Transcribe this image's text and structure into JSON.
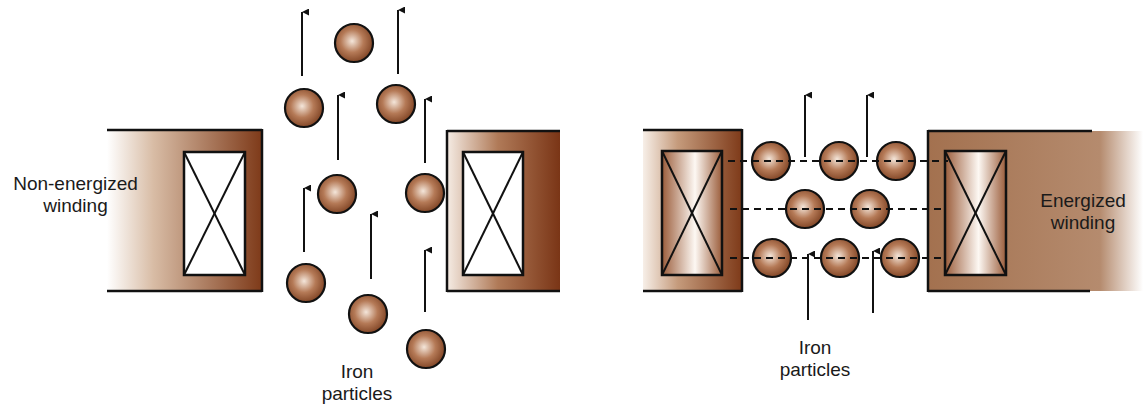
{
  "panels": [
    {
      "id": "non-energized",
      "winding_label_line1": "Non-energized",
      "winding_label_line2": "winding",
      "particles_label_line1": "Iron",
      "particles_label_line2": "particles"
    },
    {
      "id": "energized",
      "winding_label_line1": "Energized",
      "winding_label_line2": "winding",
      "particles_label_line1": "Iron",
      "particles_label_line2": "particles"
    }
  ],
  "colors": {
    "core_dark": "#7a3a1a",
    "core_light": "#f7efe8",
    "particle": "#9a5a3a",
    "stroke": "#111111"
  }
}
